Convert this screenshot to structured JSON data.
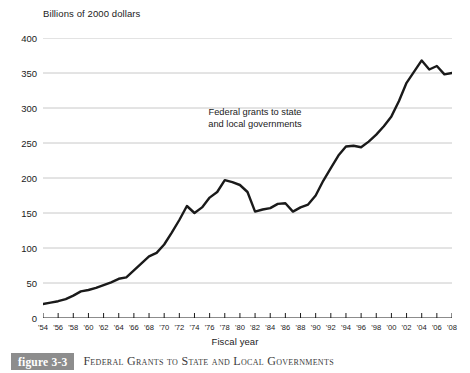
{
  "figure": {
    "tag": "figure 3-3",
    "caption": "Federal Grants to State and Local Governments"
  },
  "annotation": {
    "line1": "Federal grants to state",
    "line2": "and local governments"
  },
  "chart_data": {
    "type": "line",
    "title": "Federal Grants to State and Local Governments",
    "xlabel": "Fiscal year",
    "ylabel": "Billions of 2000 dollars",
    "ylim": [
      0,
      400
    ],
    "xlim": [
      1954,
      2008
    ],
    "ytick_step": 50,
    "xtick_step": 2,
    "grid": "horizontal",
    "legend": "none",
    "line_color": "#1a1a1a",
    "grid_color": "#c8c8c8",
    "yticks": [
      "0",
      "50",
      "100",
      "150",
      "200",
      "250",
      "300",
      "350",
      "400"
    ],
    "xticks": [
      "'54",
      "'56",
      "'58",
      "'60",
      "'62",
      "'64",
      "'66",
      "'68",
      "'70",
      "'72",
      "'74",
      "'76",
      "'78",
      "'80",
      "'82",
      "'84",
      "'86",
      "'88",
      "'90",
      "'92",
      "'94",
      "'96",
      "'98",
      "'00",
      "'02",
      "'04",
      "'06",
      "'08"
    ],
    "x": [
      1954,
      1955,
      1956,
      1957,
      1958,
      1959,
      1960,
      1961,
      1962,
      1963,
      1964,
      1965,
      1966,
      1967,
      1968,
      1969,
      1970,
      1971,
      1972,
      1973,
      1974,
      1975,
      1976,
      1977,
      1978,
      1979,
      1980,
      1981,
      1982,
      1983,
      1984,
      1985,
      1986,
      1987,
      1988,
      1989,
      1990,
      1991,
      1992,
      1993,
      1994,
      1995,
      1996,
      1997,
      1998,
      1999,
      2000,
      2001,
      2002,
      2003,
      2004,
      2005,
      2006,
      2007,
      2008
    ],
    "values": [
      20,
      22,
      24,
      27,
      32,
      38,
      40,
      43,
      47,
      51,
      56,
      58,
      68,
      78,
      88,
      93,
      105,
      122,
      140,
      160,
      150,
      158,
      172,
      180,
      197,
      194,
      190,
      180,
      152,
      155,
      157,
      163,
      164,
      152,
      158,
      162,
      175,
      196,
      214,
      232,
      245,
      246,
      244,
      252,
      262,
      274,
      288,
      310,
      336,
      352,
      368,
      355,
      360,
      348,
      350
    ]
  }
}
